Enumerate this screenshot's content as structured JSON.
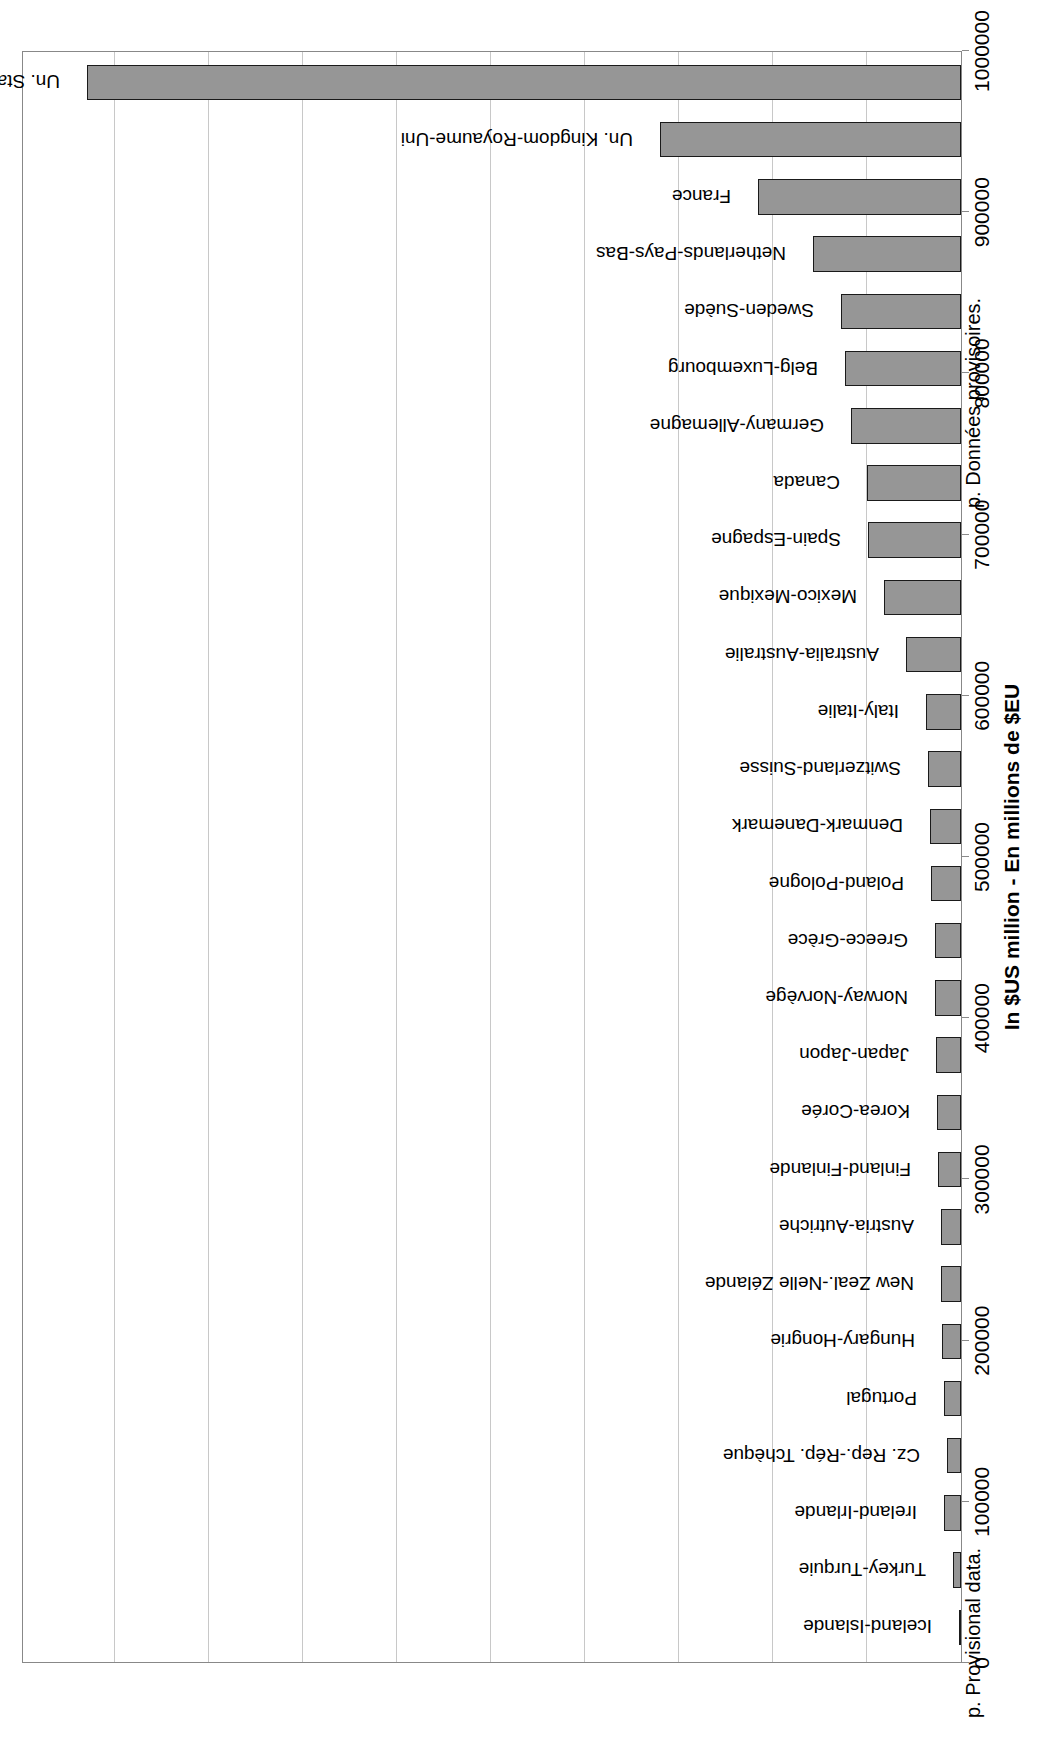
{
  "chart_data": {
    "type": "bar",
    "title": "",
    "subtitle": "",
    "xlabel": "",
    "ylabel": "In $US million - En millions de $EU",
    "orientation": "vertical-bars-on-rotated-page",
    "grid": true,
    "legend": "none",
    "ylim": [
      0,
      1000000
    ],
    "ytick_step": 100000,
    "yticks": [
      0,
      100000,
      200000,
      300000,
      400000,
      500000,
      600000,
      700000,
      800000,
      900000,
      1000000
    ],
    "ytick_labels": [
      "0",
      "100000",
      "200000",
      "300000",
      "400000",
      "500000",
      "600000",
      "700000",
      "800000",
      "900000",
      "1000000"
    ],
    "categories": [
      "Iceland-Islande",
      "Turkey-Turquie",
      "Ireland-Irlande",
      "Cz. Rep.-Rép. Tchèque",
      "Portugal",
      "Hungary-Hongrie",
      "New Zeal.-Nelle Zélande",
      "Austria-Autriche",
      "Finland-Finlande",
      "Korea-Corée",
      "Japan-Japon",
      "Norway-Norvège",
      "Greece-Grèce",
      "Poland-Pologne",
      "Denmark-Danemark",
      "Switzerland-Suisse",
      "Italy-Italie",
      "Australia-Australie",
      "Mexico-Mexique",
      "Spain-Espagne",
      "Canada",
      "Germany-Allemagne",
      "Belg-Luxembourg",
      "Sweden-Suède",
      "Netherlands-Pays-Bas",
      "France",
      "Un. Kingdom-Royaume-Uni",
      "Un. States-Etats-Unis"
    ],
    "values": [
      1500,
      8500,
      18500,
      15000,
      18000,
      20500,
      21000,
      21500,
      24500,
      25500,
      26500,
      27500,
      28000,
      31500,
      33000,
      35000,
      37000,
      58000,
      82000,
      99000,
      100000,
      117000,
      123000,
      128000,
      157000,
      216000,
      320000,
      930000
    ]
  },
  "axis": {
    "value_axis_title": "In $US million - En millions de $EU"
  },
  "footnotes": {
    "english": "p. Provisional data.",
    "french": "p. Données provisoires."
  }
}
